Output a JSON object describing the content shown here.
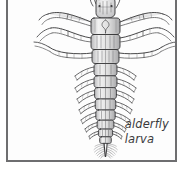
{
  "figure": {
    "kind": "scientific-illustration",
    "subject": "alderfly larva",
    "view": "dorsal",
    "medium": "pen-and-ink stipple drawing",
    "palette": {
      "background": "#ffffff",
      "plate_background": "#fdfdfd",
      "frame_border": "#6e6e70",
      "ink_dark": "#2f2f31",
      "ink_mid": "#6a6a6c",
      "ink_light": "#9b9b9d",
      "fill_body": "#e9e9e9",
      "caption_text": "#3a3a3c"
    },
    "frame": {
      "left": 6,
      "top": -2,
      "width": 171,
      "height": 164,
      "border_width": 2
    }
  },
  "caption": {
    "line1": "alderfly",
    "line2": "larva",
    "full_text": "alderfly larva",
    "style": "italic"
  },
  "anatomy": {
    "head": {
      "label": "head",
      "cx": 98,
      "cy": 8,
      "width": 17,
      "height": 16
    },
    "antennae": {
      "label": "antennae",
      "count": 2
    },
    "thorax": {
      "label": "thorax",
      "segments": 3,
      "cx": 98
    },
    "legs": {
      "label": "thoracic legs",
      "pairs": 3,
      "total": 6
    },
    "abdomen": {
      "label": "abdomen",
      "segments": 8,
      "cx": 98
    },
    "lateral_filaments": {
      "label": "lateral gill filaments",
      "pairs": 7
    },
    "terminal_filament": {
      "label": "terminal filament",
      "tip_y": 150,
      "plumed": true
    }
  }
}
